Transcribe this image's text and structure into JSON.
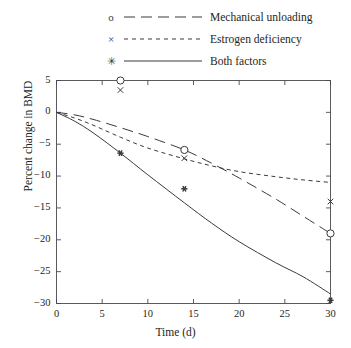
{
  "legend": {
    "items": [
      {
        "marker": "o",
        "marker_name": "circle-marker",
        "dash": "long-dash",
        "label": "Mechanical unloading"
      },
      {
        "marker": "×",
        "marker_name": "cross-marker",
        "dash": "short-dash",
        "label": "Estrogen deficiency"
      },
      {
        "marker": "✳",
        "marker_name": "asterisk-marker",
        "dash": "solid",
        "label": "Both factors"
      }
    ]
  },
  "chart_data": {
    "type": "line",
    "title": "",
    "xlabel": "Time (d)",
    "ylabel": "Percent change in BMD",
    "xlim": [
      0,
      30
    ],
    "ylim": [
      -30,
      5
    ],
    "xticks": [
      "0",
      "5",
      "10",
      "15",
      "20",
      "25",
      "30"
    ],
    "yticks": [
      "5",
      "0",
      "-5",
      "-10",
      "-15",
      "-20",
      "-25",
      "-30"
    ],
    "ytick_display": [
      "5",
      "0",
      "−5",
      "−10",
      "−15",
      "−20",
      "−25",
      "−30"
    ],
    "grid": false,
    "legend_position": "above-plot",
    "line_color": "#3a3a3a",
    "series": [
      {
        "name": "Mechanical unloading",
        "style": "long-dash",
        "marker": "o",
        "x": [
          0,
          2,
          4,
          7,
          10,
          14,
          17,
          20,
          24,
          27,
          30
        ],
        "values": [
          0,
          -0.4,
          -1.1,
          -2.4,
          -3.8,
          -5.9,
          -8.0,
          -10.3,
          -13.6,
          -16.3,
          -19.0
        ],
        "data_points": [
          {
            "x": 7,
            "y": 5.0
          },
          {
            "x": 14,
            "y": -5.9
          },
          {
            "x": 30,
            "y": -19.0
          }
        ]
      },
      {
        "name": "Estrogen deficiency",
        "style": "short-dash",
        "marker": "×",
        "x": [
          0,
          2,
          4,
          7,
          10,
          14,
          17,
          20,
          24,
          27,
          30
        ],
        "values": [
          0,
          -0.9,
          -2.0,
          -3.9,
          -5.6,
          -7.3,
          -8.4,
          -9.3,
          -10.1,
          -10.6,
          -11.0
        ],
        "data_points": [
          {
            "x": 7,
            "y": 3.5
          },
          {
            "x": 14,
            "y": -7.2
          },
          {
            "x": 30,
            "y": -14.0
          }
        ]
      },
      {
        "name": "Both factors",
        "style": "solid",
        "marker": "✳",
        "x": [
          0,
          2,
          4,
          7,
          10,
          14,
          17,
          20,
          24,
          27,
          30
        ],
        "values": [
          0,
          -1.4,
          -3.2,
          -6.4,
          -9.8,
          -14.2,
          -17.4,
          -20.3,
          -23.6,
          -25.8,
          -28.5
        ],
        "data_points": [
          {
            "x": 7,
            "y": -6.4
          },
          {
            "x": 14,
            "y": -12.0
          },
          {
            "x": 30,
            "y": -29.5
          }
        ]
      }
    ]
  }
}
